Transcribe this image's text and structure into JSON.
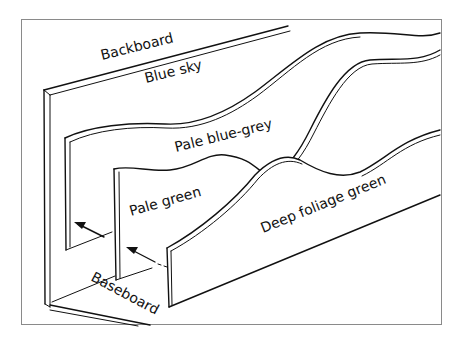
{
  "diagram": {
    "type": "layered-backdrop-illustration",
    "labels": {
      "backboard": "Backboard",
      "blue_sky": "Blue sky",
      "pale_blue_grey": "Pale blue-grey",
      "pale_green": "Pale green",
      "deep_foliage_green": "Deep foliage green",
      "baseboard": "Baseboard"
    },
    "layers": [
      {
        "order": 1,
        "name": "Backboard",
        "colour_label": "Blue sky"
      },
      {
        "order": 2,
        "name": "Middle distance panel",
        "colour_label": "Pale blue-grey"
      },
      {
        "order": 3,
        "name": "Near distance panel",
        "colour_label": "Pale green"
      },
      {
        "order": 4,
        "name": "Foreground panel",
        "colour_label": "Deep foliage green"
      }
    ],
    "arrows": [
      {
        "from": "Pale green panel",
        "to": "Pale blue-grey panel",
        "direction": "back-left"
      },
      {
        "from": "Deep foliage green panel",
        "to": "Pale green panel",
        "direction": "back-left",
        "dashed_tail": true
      }
    ],
    "colors": {
      "line": "#111111",
      "background": "#ffffff",
      "frame": "#8a8a8a"
    }
  }
}
